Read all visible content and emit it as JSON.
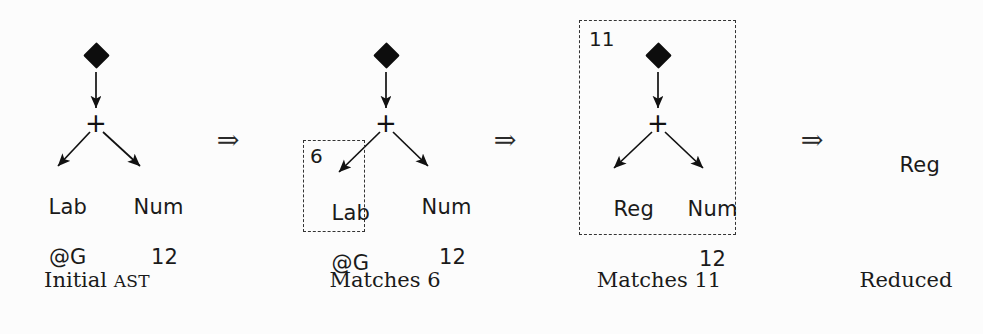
{
  "figure": {
    "background_color": "#fcfcfc",
    "ink_color": "#1a1a1a",
    "dash_color": "#333333",
    "step_arrow_glyph": "⇒"
  },
  "panels": [
    {
      "id": "initial-ast",
      "caption": "Initial ",
      "caption_smallcaps": "AST",
      "match_tag": "",
      "root_kind": "diamond",
      "operator": "+",
      "left_child": {
        "line1": "Lab",
        "line2": "@G"
      },
      "right_child": {
        "line1": "Num",
        "line2": "12"
      },
      "boxed": false
    },
    {
      "id": "matches-6",
      "caption": "Matches 6",
      "caption_smallcaps": "",
      "match_tag": "6",
      "root_kind": "diamond",
      "operator": "+",
      "left_child": {
        "line1": "Lab",
        "line2": "@G"
      },
      "right_child": {
        "line1": "Num",
        "line2": "12"
      },
      "boxed": true,
      "box_scope": "left-child"
    },
    {
      "id": "matches-11",
      "caption": "Matches 11",
      "caption_smallcaps": "",
      "match_tag": "11",
      "root_kind": "diamond",
      "operator": "+",
      "left_child": {
        "line1": "Reg",
        "line2": ""
      },
      "right_child": {
        "line1": "Num",
        "line2": "12"
      },
      "boxed": true,
      "box_scope": "whole-tree"
    },
    {
      "id": "reduced",
      "caption": "Reduced",
      "caption_smallcaps": "",
      "match_tag": "",
      "root_kind": "none",
      "operator": "",
      "left_child": {
        "line1": "Reg",
        "line2": ""
      },
      "right_child": {
        "line1": "",
        "line2": ""
      },
      "boxed": false
    }
  ],
  "transitions": [
    {
      "id": "step-1",
      "glyph": "⇒"
    },
    {
      "id": "step-2",
      "glyph": "⇒"
    },
    {
      "id": "step-3",
      "glyph": "⇒"
    }
  ]
}
